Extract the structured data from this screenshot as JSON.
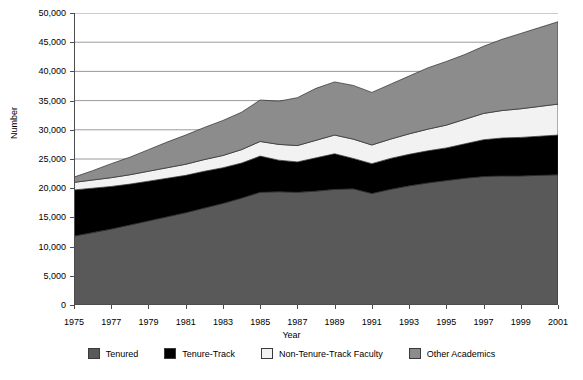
{
  "chart_data": {
    "type": "area",
    "stacked": true,
    "title": "",
    "xlabel": "Year",
    "ylabel": "Number",
    "x": [
      1975,
      1976,
      1977,
      1978,
      1979,
      1980,
      1981,
      1982,
      1983,
      1984,
      1985,
      1986,
      1987,
      1988,
      1989,
      1990,
      1991,
      1992,
      1993,
      1994,
      1995,
      1996,
      1997,
      1998,
      1999,
      2000,
      2001
    ],
    "xticks": [
      "1975",
      "1977",
      "1979",
      "1981",
      "1983",
      "1985",
      "1987",
      "1989",
      "1991",
      "1993",
      "1995",
      "1997",
      "1999",
      "2001"
    ],
    "yticks": [
      "0",
      "5,000",
      "10,000",
      "15,000",
      "20,000",
      "25,000",
      "30,000",
      "35,000",
      "40,000",
      "45,000",
      "50,000"
    ],
    "ylim": [
      0,
      50000
    ],
    "xlim": [
      1975,
      2001
    ],
    "grid": true,
    "legend_position": "bottom",
    "series": [
      {
        "name": "Tenured",
        "color": "#595959",
        "values": [
          11800,
          12400,
          13000,
          13700,
          14400,
          15100,
          15800,
          16600,
          17400,
          18300,
          19300,
          19400,
          19300,
          19500,
          19800,
          19900,
          19100,
          19800,
          20400,
          20900,
          21300,
          21700,
          22000,
          22100,
          22100,
          22200,
          22300
        ]
      },
      {
        "name": "Tenure-Track",
        "color": "#000000",
        "values": [
          7900,
          7600,
          7300,
          7000,
          6800,
          6600,
          6400,
          6300,
          6100,
          6000,
          6200,
          5400,
          5200,
          5700,
          6100,
          5200,
          5100,
          5300,
          5400,
          5500,
          5600,
          5900,
          6300,
          6500,
          6600,
          6700,
          6800
        ]
      },
      {
        "name": "Non-Tenure-Track Faculty",
        "color": "#f2f2f2",
        "values": [
          1300,
          1400,
          1500,
          1600,
          1700,
          1800,
          1900,
          2000,
          2100,
          2300,
          2500,
          2700,
          2800,
          3000,
          3200,
          3300,
          3200,
          3300,
          3500,
          3700,
          3900,
          4200,
          4500,
          4700,
          4900,
          5100,
          5300
        ]
      },
      {
        "name": "Other Academics",
        "color": "#8c8c8c",
        "values": [
          900,
          1600,
          2400,
          3000,
          3700,
          4400,
          5000,
          5500,
          6000,
          6400,
          7100,
          7400,
          8200,
          8900,
          9100,
          9200,
          9000,
          9400,
          9900,
          10500,
          10900,
          11100,
          11500,
          12200,
          12900,
          13500,
          14100
        ]
      }
    ]
  }
}
